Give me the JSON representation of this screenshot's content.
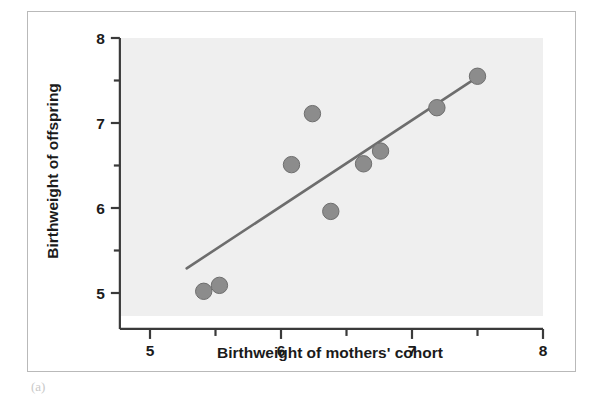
{
  "figure": {
    "panel_mark": "(a)",
    "frame_color": "#b9b9b9",
    "plot_background": "#efefef",
    "point_color": "#8c8c8c",
    "point_edge_color": "#6e6e6e",
    "line_color": "#6d6d6d",
    "axis_color": "#3a3a3a"
  },
  "chart_data": {
    "type": "scatter",
    "title": "",
    "xlabel": "Birthweight of mothers' cohort",
    "ylabel": "Birthweight of offspring",
    "xlim": [
      4.77,
      8.0
    ],
    "ylim": [
      4.73,
      8.0
    ],
    "xticks": [
      5,
      6,
      7,
      8
    ],
    "xtick_labels": [
      "5",
      "6",
      "7",
      "8"
    ],
    "x_minor_ticks": [
      5.5,
      6.5,
      7.5
    ],
    "yticks": [
      5,
      6,
      7,
      8
    ],
    "ytick_labels": [
      "5",
      "6",
      "7",
      "8"
    ],
    "y_minor_ticks": [
      5.5,
      6.5,
      7.5
    ],
    "grid": false,
    "legend": null,
    "points": [
      {
        "x": 5.41,
        "y": 5.02
      },
      {
        "x": 5.53,
        "y": 5.09
      },
      {
        "x": 6.08,
        "y": 6.51
      },
      {
        "x": 6.24,
        "y": 7.11
      },
      {
        "x": 6.38,
        "y": 5.96
      },
      {
        "x": 6.63,
        "y": 6.52
      },
      {
        "x": 6.76,
        "y": 6.67
      },
      {
        "x": 7.19,
        "y": 7.18
      },
      {
        "x": 7.5,
        "y": 7.55
      }
    ],
    "series": [
      {
        "name": "regression-line",
        "type": "line",
        "x": [
          5.28,
          7.54
        ],
        "y": [
          5.29,
          7.58
        ]
      }
    ],
    "annotations": []
  }
}
